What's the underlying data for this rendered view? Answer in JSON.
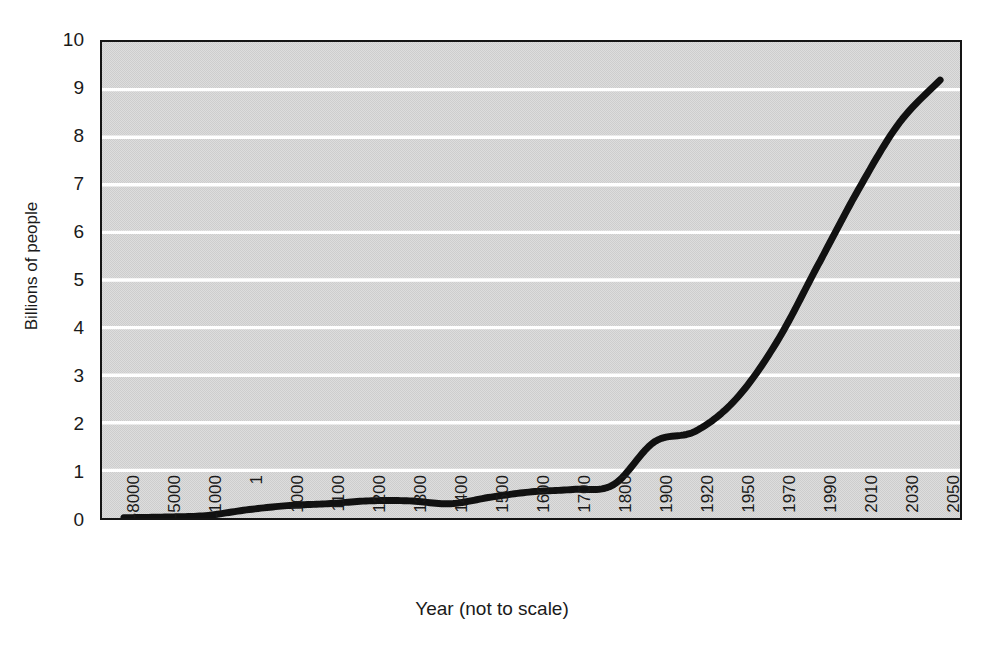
{
  "chart_data": {
    "type": "line",
    "title": "",
    "xlabel": "Year (not to scale)",
    "ylabel": "Billions of people",
    "ylim": [
      0,
      10
    ],
    "yticks": [
      0,
      1,
      2,
      3,
      4,
      5,
      6,
      7,
      8,
      9,
      10
    ],
    "ytick_labels": [
      "0",
      "1",
      "2",
      "3",
      "4",
      "5",
      "6",
      "7",
      "8",
      "9",
      "10"
    ],
    "grid": "horizontal-white-gridlines",
    "legend": "none",
    "x_note": "categories are evenly spaced on the axis although the year intervals are unequal",
    "categories": [
      "-8000",
      "-5000",
      "-1000",
      "1",
      "1000",
      "1100",
      "1200",
      "1300",
      "1400",
      "1500",
      "1600",
      "1700",
      "1800",
      "1900",
      "1920",
      "1950",
      "1970",
      "1990",
      "2010",
      "2030",
      "2050"
    ],
    "xtick_labels": [
      "-8000",
      "-5000",
      "-1000",
      "1",
      "1000",
      "1100",
      "1200",
      "1300",
      "1400",
      "1500",
      "1600",
      "1700",
      "1800",
      "1900",
      "1920",
      "1950",
      "1970",
      "1990",
      "2010",
      "2030",
      "2050"
    ],
    "series": [
      {
        "name": "World population",
        "values": [
          0.005,
          0.02,
          0.05,
          0.17,
          0.26,
          0.3,
          0.36,
          0.36,
          0.3,
          0.44,
          0.55,
          0.6,
          0.7,
          1.6,
          1.82,
          2.5,
          3.7,
          5.3,
          6.9,
          8.3,
          9.2
        ]
      }
    ],
    "annotations": [
      "population stays near zero until about year 1",
      "small decline around 1400",
      "slight plateau just after 1900",
      "steep acceleration from 1950 onward"
    ]
  },
  "axes": {
    "y_title": "Billions of people",
    "x_title": "Year (not to scale)"
  },
  "colors": {
    "plot_background": "#cdcdcd",
    "gridline": "#ffffff",
    "curve": "#111111",
    "frame": "#151515",
    "text": "#1a1a1a"
  }
}
